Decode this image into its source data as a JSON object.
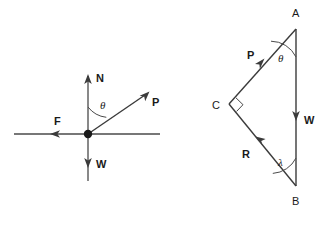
{
  "figure": {
    "background_color": "#ffffff",
    "line_color": "#3b3b3b",
    "label_color": "#1a1a1a",
    "width": 329,
    "height": 229
  },
  "left_diagram": {
    "name": "free-body-diagram",
    "origin": {
      "x": 88,
      "y": 134
    },
    "vectors": [
      {
        "label": "N",
        "description": "normal force, points vertically up",
        "label_x": 96,
        "label_y": 82,
        "from": {
          "x": 88,
          "y": 134
        },
        "to": {
          "x": 88,
          "y": 76
        }
      },
      {
        "label": "P",
        "description": "applied force, points up and to the right",
        "label_x": 152,
        "label_y": 106,
        "from": {
          "x": 88,
          "y": 134
        },
        "to": {
          "x": 147,
          "y": 93
        }
      },
      {
        "label": "F",
        "description": "friction force, points horizontally left",
        "label_x": 54,
        "label_y": 125,
        "from": {
          "x": 88,
          "y": 134
        },
        "to": {
          "x": 52,
          "y": 134
        }
      },
      {
        "label": "W",
        "description": "weight, points vertically down",
        "label_x": 96,
        "label_y": 168,
        "from": {
          "x": 88,
          "y": 134
        },
        "to": {
          "x": 88,
          "y": 166
        }
      }
    ],
    "axes": {
      "horizontal": {
        "x1": 14,
        "y1": 134,
        "x2": 160,
        "y2": 134
      },
      "vertical": {
        "x1": 88,
        "y1": 76,
        "x2": 88,
        "y2": 181
      }
    },
    "angle": {
      "symbol": "θ",
      "name": "theta",
      "description": "angle between the normal axis N and vector P",
      "label_x": 100,
      "label_y": 109
    }
  },
  "right_diagram": {
    "name": "force-triangle",
    "vertices": [
      {
        "label": "A",
        "x": 296,
        "y": 29,
        "label_x": 293,
        "label_y": 15
      },
      {
        "label": "B",
        "x": 296,
        "y": 186,
        "label_x": 293,
        "label_y": 202
      },
      {
        "label": "C",
        "x": 229,
        "y": 104,
        "label_x": 214,
        "label_y": 108
      }
    ],
    "sides": [
      {
        "label": "P",
        "description": "side C to A, arrow pointing toward A",
        "label_x": 250,
        "label_y": 56,
        "from": {
          "x": 229,
          "y": 104
        },
        "to": {
          "x": 296,
          "y": 29
        }
      },
      {
        "label": "W",
        "description": "side A to B, vertical, arrow pointing down",
        "label_x": 305,
        "label_y": 121,
        "from": {
          "x": 296,
          "y": 29
        },
        "to": {
          "x": 296,
          "y": 186
        }
      },
      {
        "label": "R",
        "description": "side B to C, arrow pointing toward C",
        "label_x": 245,
        "label_y": 155,
        "from": {
          "x": 296,
          "y": 186
        },
        "to": {
          "x": 229,
          "y": 104
        }
      }
    ],
    "angles": [
      {
        "symbol": "θ",
        "name": "theta",
        "at_vertex": "A",
        "label_x": 281,
        "label_y": 60
      },
      {
        "symbol": "λ",
        "name": "lambda",
        "at_vertex": "B",
        "label_x": 281,
        "label_y": 163
      },
      {
        "symbol": "∟",
        "name": "right-angle-marker",
        "at_vertex": "C",
        "label_x": 0,
        "label_y": 0
      }
    ]
  }
}
